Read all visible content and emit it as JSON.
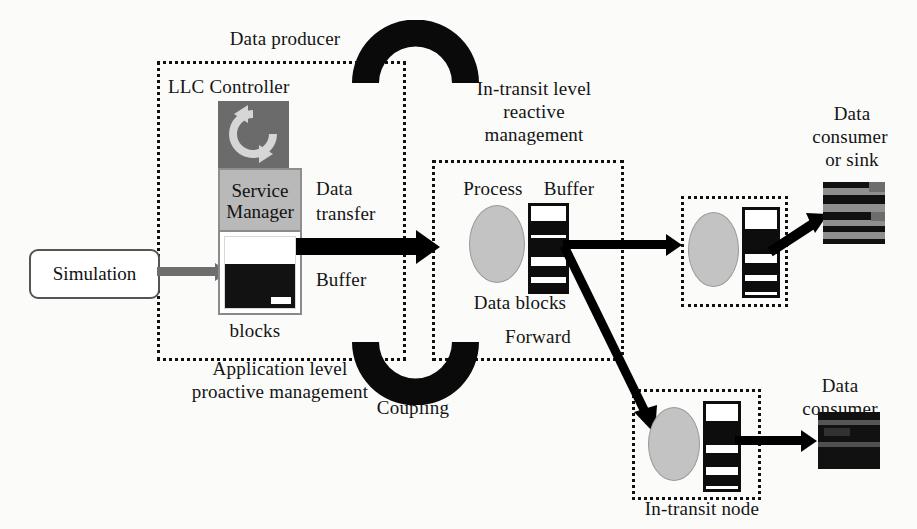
{
  "diagram": {
    "colors": {
      "background": "#fbfbfa",
      "ink": "#111111",
      "gray_arrow": "#6e6e6e",
      "process_fill": "#c3c3c3",
      "service_manager_fill": "#b9b9b9",
      "llc_icon_fill": "#6b6b6b",
      "buffer_fill": "#121212",
      "tile_fill": "#111111"
    }
  },
  "labels": {
    "data_producer": "Data producer",
    "llc_controller": "LLC Controller",
    "service_manager_line1": "Service",
    "service_manager_line2": "Manager",
    "simulation": "Simulation",
    "data_transfer_line1": "Data",
    "data_transfer_line2": "transfer",
    "producer_buffer": "Buffer",
    "producer_data_blocks_line1": "Data",
    "producer_data_blocks_line2": "blocks",
    "application_level_line1": "Application level",
    "application_level_line2": "proactive management",
    "coupling": "Coupling",
    "in_transit_level_line1": "In-transit level",
    "in_transit_level_line2": "reactive",
    "in_transit_level_line3": "management",
    "process": "Process",
    "transit_buffer": "Buffer",
    "transit_data_blocks": "Data blocks",
    "forward": "Forward",
    "data_consumer_or_sink_line1": "Data",
    "data_consumer_or_sink_line2": "consumer",
    "data_consumer_or_sink_line3": "or sink",
    "data_consumer_line1": "Data",
    "data_consumer_line2": "consumer",
    "in_transit_node": "In-transit node"
  },
  "icons": {
    "llc_refresh": "refresh-cycle-icon",
    "coupling_top": "coupling-arc-top-icon",
    "coupling_bottom": "coupling-arc-bottom-icon"
  },
  "buffers": {
    "producer": {
      "fill_percent": 62,
      "notch": true
    },
    "transit_center": {
      "bands": [
        18,
        34,
        56,
        70,
        84
      ]
    },
    "transit_top_right": {
      "bands": [
        22,
        38,
        60,
        76,
        88
      ]
    },
    "transit_bottom_right": {
      "bands": [
        20,
        36,
        58,
        74,
        88
      ]
    }
  }
}
